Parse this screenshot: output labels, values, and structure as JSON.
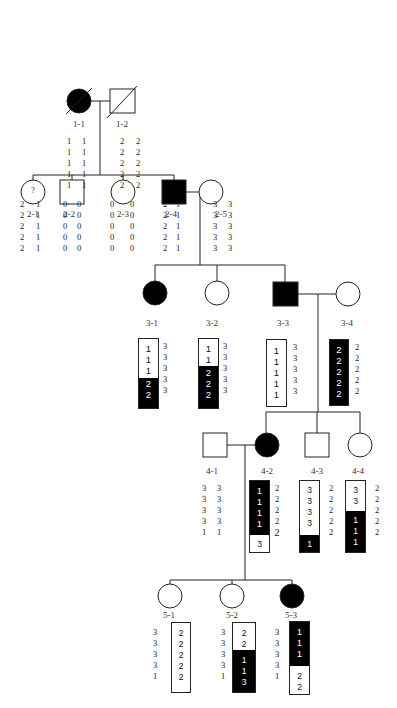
{
  "diagram": {
    "type": "pedigree",
    "generations": [
      {
        "id": "I",
        "members": [
          {
            "id": "1-1",
            "sex": "female",
            "affected": true,
            "deceased": true,
            "haplotype_left": [
              "1",
              "1",
              "1",
              "1",
              "1"
            ],
            "haplotype_right": [
              "1",
              "1",
              "1",
              "1",
              "1"
            ]
          },
          {
            "id": "1-2",
            "sex": "male",
            "affected": false,
            "deceased": true,
            "haplotype_left": [
              "2",
              "2",
              "2",
              "2",
              "2"
            ],
            "haplotype_right": [
              "2",
              "2",
              "2",
              "2",
              "2"
            ]
          }
        ]
      },
      {
        "id": "II",
        "members": [
          {
            "id": "2-1",
            "sex": "female",
            "affected": false,
            "status_mark": "?",
            "haplotype_left": [
              "2",
              "2",
              "2",
              "2",
              "2"
            ],
            "haplotype_right": [
              "1",
              "1",
              "1",
              "1",
              "1"
            ]
          },
          {
            "id": "2-2",
            "sex": "male",
            "affected": false,
            "haplotype_left": [
              "0",
              "0",
              "0",
              "0",
              "0"
            ],
            "haplotype_right": [
              "0",
              "0",
              "0",
              "0",
              "0"
            ]
          },
          {
            "id": "2-3",
            "sex": "female",
            "affected": false,
            "haplotype_left": [
              "0",
              "0",
              "0",
              "0",
              "0"
            ],
            "haplotype_right": [
              "0",
              "0",
              "0",
              "0",
              "0"
            ]
          },
          {
            "id": "2-4",
            "sex": "male",
            "affected": true,
            "haplotype_left": [
              "2",
              "2",
              "2",
              "2",
              "2"
            ],
            "haplotype_right": [
              "1",
              "1",
              "1",
              "1",
              "1"
            ]
          },
          {
            "id": "2-5",
            "sex": "female",
            "affected": false,
            "haplotype_left": [
              "3",
              "3",
              "3",
              "3",
              "3"
            ],
            "haplotype_right": [
              "3",
              "3",
              "3",
              "3",
              "3"
            ]
          }
        ]
      },
      {
        "id": "III",
        "members": [
          {
            "id": "3-1",
            "sex": "female",
            "affected": true,
            "boxed_haplotype": [
              "1",
              "1",
              "1",
              "2",
              "2"
            ],
            "boxed_segments": [
              "white",
              "white",
              "white",
              "black",
              "black"
            ],
            "side_haplotype": [
              "3",
              "3",
              "3",
              "3",
              "3"
            ]
          },
          {
            "id": "3-2",
            "sex": "female",
            "affected": false,
            "boxed_haplotype": [
              "1",
              "1",
              "2",
              "2",
              "2"
            ],
            "boxed_segments": [
              "white",
              "white",
              "black",
              "black",
              "black"
            ],
            "side_haplotype": [
              "3",
              "3",
              "3",
              "3",
              "3"
            ]
          },
          {
            "id": "3-3",
            "sex": "male",
            "affected": true,
            "boxed_haplotype": [
              "1",
              "1",
              "1",
              "1",
              "1"
            ],
            "boxed_segments": [
              "white",
              "white",
              "white",
              "white",
              "white"
            ],
            "side_haplotype": [
              "3",
              "3",
              "3",
              "3",
              "3"
            ]
          },
          {
            "id": "3-4",
            "sex": "female",
            "affected": false,
            "boxed_haplotype": [
              "2",
              "2",
              "2",
              "2",
              "2"
            ],
            "boxed_segments": [
              "black",
              "black",
              "black",
              "black",
              "black"
            ],
            "side_haplotype": [
              "2",
              "2",
              "2",
              "2",
              "2"
            ]
          }
        ]
      },
      {
        "id": "IV",
        "members": [
          {
            "id": "4-1",
            "sex": "male",
            "affected": false,
            "haplotype_left": [
              "3",
              "3",
              "3",
              "3",
              "1"
            ],
            "haplotype_right": [
              "3",
              "3",
              "3",
              "3",
              "1"
            ]
          },
          {
            "id": "4-2",
            "sex": "female",
            "affected": true,
            "boxed_haplotype": [
              "1",
              "1",
              "1",
              "1",
              "",
              "3"
            ],
            "boxed_segments": [
              "black",
              "black",
              "black",
              "black",
              "black",
              "white"
            ],
            "side_haplotype": [
              "2",
              "2",
              "2",
              "2",
              "2"
            ]
          },
          {
            "id": "4-3",
            "sex": "male",
            "affected": false,
            "boxed_haplotype": [
              "3",
              "3",
              "3",
              "3",
              "",
              "1"
            ],
            "boxed_segments": [
              "white",
              "white",
              "white",
              "white",
              "white",
              "black"
            ],
            "side_haplotype": [
              "2",
              "2",
              "2",
              "2",
              "2"
            ]
          },
          {
            "id": "4-4",
            "sex": "female",
            "affected": false,
            "boxed_haplotype": [
              "3",
              "3",
              "1",
              "1",
              "1"
            ],
            "boxed_segments": [
              "white",
              "white",
              "black",
              "black",
              "black"
            ],
            "side_haplotype": [
              "2",
              "2",
              "2",
              "2",
              "2"
            ]
          }
        ]
      },
      {
        "id": "V",
        "members": [
          {
            "id": "5-1",
            "sex": "female",
            "affected": false,
            "side_haplotype": [
              "3",
              "3",
              "3",
              "3",
              "1"
            ],
            "boxed_haplotype": [
              "2",
              "2",
              "2",
              "2",
              "2"
            ],
            "boxed_segments": [
              "white",
              "white",
              "white",
              "white",
              "white"
            ]
          },
          {
            "id": "5-2",
            "sex": "female",
            "affected": false,
            "side_haplotype": [
              "3",
              "3",
              "3",
              "3",
              "1"
            ],
            "boxed_haplotype": [
              "2",
              "2",
              "1",
              "1",
              "3"
            ],
            "boxed_segments": [
              "white",
              "white",
              "black",
              "black",
              "black"
            ]
          },
          {
            "id": "5-3",
            "sex": "female",
            "affected": true,
            "side_haplotype": [
              "3",
              "3",
              "3",
              "3",
              "1"
            ],
            "boxed_haplotype": [
              "1",
              "1",
              "1",
              "2",
              "2"
            ],
            "boxed_segments": [
              "black",
              "black",
              "black",
              "white",
              "white"
            ]
          }
        ]
      }
    ],
    "couples": [
      {
        "partners": [
          "1-1",
          "1-2"
        ],
        "children": [
          "2-1",
          "2-2",
          "2-3",
          "2-4"
        ]
      },
      {
        "partners": [
          "2-4",
          "2-5"
        ],
        "children": [
          "3-1",
          "3-2",
          "3-3"
        ]
      },
      {
        "partners": [
          "3-3",
          "3-4"
        ],
        "children": [
          "4-2",
          "4-3",
          "4-4"
        ]
      },
      {
        "partners": [
          "4-1",
          "4-2"
        ],
        "children": [
          "5-1",
          "5-2",
          "5-3"
        ]
      }
    ],
    "colors": {
      "affected": "#000000",
      "unaffected": "#ffffff",
      "line": "#222222"
    }
  },
  "labels": {
    "1-1": "1-1",
    "1-2": "1-2",
    "2-1": "2-1",
    "2-2": "2-2",
    "2-3": "2-3",
    "2-4": "2-4",
    "2-5": "2-5",
    "3-1": "3-1",
    "3-2": "3-2",
    "3-3": "3-3",
    "3-4": "3-4",
    "4-1": "4-1",
    "4-2": "4-2",
    "4-3": "4-3",
    "4-4": "4-4",
    "5-1": "5-1",
    "5-2": "5-2",
    "5-3": "5-3",
    "question_mark": "?"
  }
}
